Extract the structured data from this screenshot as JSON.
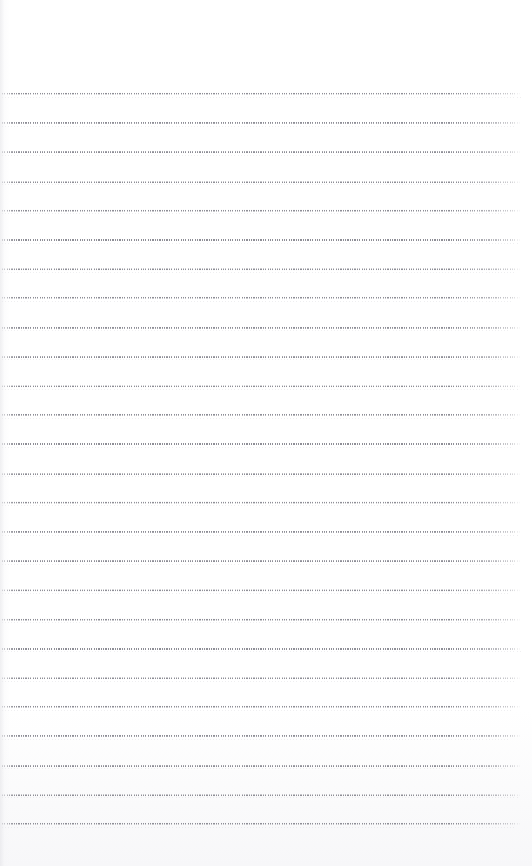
{
  "document": {
    "kind": "ruled-notebook-page",
    "title": "",
    "body_text": "",
    "page_number": "",
    "background_color": "#ffffff",
    "rule_color": "#8e8e96",
    "page_width": 532,
    "page_height": 866
  },
  "ruling": {
    "style": "dotted",
    "line_count": 26,
    "first_line_y": 94,
    "line_spacing": 29.2,
    "line_left": 2,
    "line_right": 521,
    "line_thickness": 2,
    "dot_pitch": 2.35,
    "top_margin": 94,
    "bottom_margin": 42,
    "lines_y": [
      94,
      123.2,
      152.4,
      181.6,
      210.8,
      240,
      269.2,
      298.4,
      327.6,
      356.8,
      386,
      415.2,
      444.4,
      473.6,
      502.8,
      532,
      561.2,
      590.4,
      619.6,
      648.8,
      678,
      707.2,
      736.4,
      765.6,
      794.8,
      824
    ]
  },
  "content": {
    "handwriting": [],
    "annotations": [],
    "notes": ""
  }
}
